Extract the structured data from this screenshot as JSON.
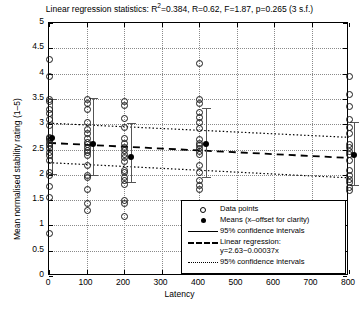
{
  "chart_data": {
    "type": "scatter",
    "title_prefix": "Linear regression statistics: R",
    "title_sup": "2",
    "title_suffix": "=0.384, R=0.62, F=1.87, p=0.265 (3 s.f.)",
    "xlabel": "Latency",
    "ylabel": "Mean normalised stability rating (1–5)",
    "xlim": [
      0,
      800
    ],
    "ylim": [
      0,
      5
    ],
    "xticks": [
      0,
      100,
      200,
      300,
      400,
      500,
      600,
      700,
      800
    ],
    "yticks": [
      0,
      0.5,
      1,
      1.5,
      2,
      2.5,
      3,
      3.5,
      4,
      4.5,
      5
    ],
    "xticklabels": [
      "0",
      "100",
      "200",
      "300",
      "400",
      "500",
      "600",
      "700",
      "800"
    ],
    "yticklabels": [
      "0",
      "0.5",
      "1",
      "1.5",
      "2",
      "2.5",
      "3",
      "3.5",
      "4",
      "4.5",
      "5"
    ],
    "grid": true,
    "legend_position": "lower right",
    "regression": {
      "intercept": 2.63,
      "slope": -0.00037,
      "equation": "y=2.63−0.00037x",
      "r_squared": 0.384,
      "r": 0.62,
      "f": 1.87,
      "p": 0.265
    },
    "confidence_band": {
      "level": 95,
      "upper_at_x0": 3.02,
      "upper_at_x800": 2.74,
      "lower_at_x0": 2.24,
      "lower_at_x800": 1.94
    },
    "series": [
      {
        "name": "Data points",
        "marker": "open-circle",
        "groups": [
          {
            "x": 0,
            "values": [
              4.28,
              3.95,
              3.5,
              3.45,
              3.3,
              3.22,
              3.1,
              2.98,
              2.75,
              2.72,
              2.68,
              2.62,
              2.58,
              2.52,
              2.45,
              2.4,
              2.3,
              2.05,
              2.0,
              1.78,
              1.56,
              0.85
            ]
          },
          {
            "x": 100,
            "values": [
              3.5,
              3.42,
              3.3,
              3.05,
              2.9,
              2.82,
              2.72,
              2.65,
              2.6,
              2.55,
              2.5,
              2.45,
              2.4,
              2.2,
              2.0,
              1.95,
              1.72,
              1.45,
              1.3
            ]
          },
          {
            "x": 200,
            "values": [
              3.45,
              3.38,
              3.12,
              2.95,
              2.72,
              2.62,
              2.55,
              2.5,
              2.42,
              2.35,
              2.28,
              2.1,
              2.05,
              1.95,
              1.9,
              1.82,
              1.5,
              1.45,
              1.18
            ]
          },
          {
            "x": 400,
            "values": [
              4.2,
              3.5,
              3.42,
              3.25,
              3.15,
              3.05,
              2.92,
              2.7,
              2.62,
              2.58,
              2.52,
              2.48,
              2.42,
              2.2,
              2.05,
              1.9,
              1.8,
              1.72
            ]
          },
          {
            "x": 800,
            "values": [
              3.95,
              3.6,
              3.35,
              3.1,
              2.95,
              2.82,
              2.6,
              2.55,
              2.48,
              2.42,
              2.3,
              2.1,
              2.0,
              1.92,
              1.85,
              1.75,
              1.7
            ]
          }
        ]
      },
      {
        "name": "Means (x-offset for clarity)",
        "marker": "filled-circle",
        "points": [
          {
            "x": 8,
            "y": 2.72,
            "ci_low": 2.02,
            "ci_high": 3.5
          },
          {
            "x": 118,
            "y": 2.6,
            "ci_low": 2.0,
            "ci_high": 3.52
          },
          {
            "x": 218,
            "y": 2.35,
            "ci_low": 1.85,
            "ci_high": 3.02
          },
          {
            "x": 418,
            "y": 2.6,
            "ci_low": 1.95,
            "ci_high": 3.32
          },
          {
            "x": 812,
            "y": 2.4,
            "ci_low": 1.8,
            "ci_high": 3.05
          }
        ]
      }
    ],
    "legend": [
      {
        "key": "open-circle",
        "label": "Data points"
      },
      {
        "key": "filled-circle",
        "label": "Means (x–offset for clarity)"
      },
      {
        "key": "solid-line",
        "label": "95% confidence intervals"
      },
      {
        "key": "dashed-line",
        "label": "Linear regression:",
        "label2": "y=2.63−0.00037x"
      },
      {
        "key": "dotted-line",
        "label": "95% confidence intervals"
      }
    ]
  }
}
